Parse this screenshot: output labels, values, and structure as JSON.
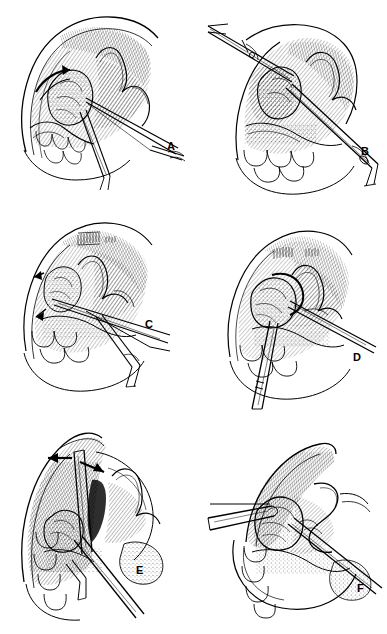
{
  "figure": {
    "background_color": "#ffffff",
    "ink_color": "#000000",
    "panel_count": 6,
    "layout": "2 columns x 3 rows",
    "panel_width": 193,
    "panel_height": 211
  },
  "panels": [
    {
      "id": "a",
      "label": "A",
      "caption": "Step A",
      "content_description": "Retracted tissue flap with curved arrow over upper field; long forceps enters from lower right toward the exposed lesion; scalloped teeth row at lower left.",
      "instruments": [
        "long-forceps"
      ],
      "arrows": 1,
      "label_position": {
        "x": 167,
        "y": 141
      }
    },
    {
      "id": "b",
      "label": "B",
      "caption": "Step B",
      "content_description": "Second instrument introduced from upper left across the field while the primary instrument grasps tissue at center; heavy hatching on the retracted flap.",
      "instruments": [
        "scissors-upper-left",
        "long-forceps-lower-right"
      ],
      "arrows": 0,
      "label_position": {
        "x": 361,
        "y": 146
      }
    },
    {
      "id": "c",
      "label": "C",
      "caption": "Step C",
      "content_description": "Dissection advanced; small directional arrows at left margin of the cavity; double instrument shafts exit to lower right.",
      "instruments": [
        "long-forceps",
        "retractor"
      ],
      "arrows": 2,
      "label_position": {
        "x": 145,
        "y": 319
      }
    },
    {
      "id": "d",
      "label": "D",
      "caption": "Step D",
      "content_description": "Specimen elevated at center; one instrument passes to the right and a second shaft descends vertically at lower left.",
      "instruments": [
        "elevator",
        "long-forceps"
      ],
      "arrows": 0,
      "label_position": {
        "x": 353,
        "y": 352
      }
    },
    {
      "id": "e",
      "label": "E",
      "caption": "Step E",
      "content_description": "Two solid black arrows indicate lateral traction directions at the top of the field; vertical instrument splits the densely hatched flap.",
      "instruments": [
        "vertical-retractor",
        "long-forceps"
      ],
      "arrows": 2,
      "label_position": {
        "x": 136,
        "y": 565
      }
    },
    {
      "id": "f",
      "label": "F",
      "caption": "Step F",
      "content_description": "Final closure view; blunt instrument from the left supports the site while the working instrument exits to the lower right.",
      "instruments": [
        "blunt-retractor-left",
        "long-forceps-right"
      ],
      "arrows": 0,
      "label_position": {
        "x": 357,
        "y": 583
      }
    }
  ]
}
